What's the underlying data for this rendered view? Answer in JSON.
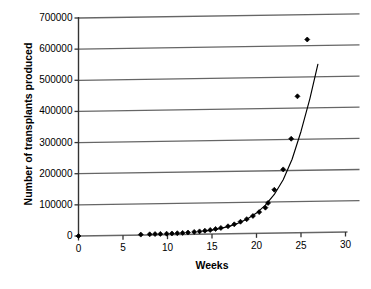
{
  "chart_data": {
    "type": "scatter",
    "title": "",
    "subtitle": "",
    "xlabel": "Weeks",
    "ylabel": "Number of transplants produced",
    "xlim": [
      0,
      30
    ],
    "ylim": [
      0,
      700000
    ],
    "xticks": [
      0,
      5,
      10,
      15,
      20,
      25,
      30
    ],
    "xtick_labels": [
      "0",
      "5",
      "10",
      "15",
      "20",
      "25",
      "30"
    ],
    "yticks": [
      0,
      100000,
      200000,
      300000,
      400000,
      500000,
      600000,
      700000
    ],
    "ytick_labels": [
      "0",
      "100000",
      "200000",
      "300000",
      "400000",
      "500000",
      "600000",
      "700000"
    ],
    "grid": "horizontal",
    "legend": "none",
    "marker": "diamond",
    "marker_color": "#000000",
    "line_color": "#000000",
    "grid_color": "#666666",
    "axis_color": "#333333",
    "background": "#ffffff",
    "series": [
      {
        "name": "Observed transplants",
        "type": "scatter",
        "points": [
          [
            0,
            0
          ],
          [
            7.0,
            1500
          ],
          [
            8.0,
            2000
          ],
          [
            8.6,
            2500
          ],
          [
            9.2,
            2800
          ],
          [
            9.9,
            3200
          ],
          [
            10.5,
            3600
          ],
          [
            11.1,
            4200
          ],
          [
            11.7,
            5000
          ],
          [
            12.3,
            6000
          ],
          [
            13.0,
            7500
          ],
          [
            13.6,
            9000
          ],
          [
            14.2,
            11000
          ],
          [
            14.8,
            13000
          ],
          [
            15.4,
            16000
          ],
          [
            16.0,
            19000
          ],
          [
            16.8,
            24000
          ],
          [
            17.5,
            30000
          ],
          [
            18.2,
            38000
          ],
          [
            18.9,
            46000
          ],
          [
            19.6,
            56000
          ],
          [
            20.3,
            68000
          ],
          [
            21.0,
            82000
          ],
          [
            21.3,
            97000
          ],
          [
            22.0,
            139000
          ],
          [
            23.0,
            204000
          ],
          [
            23.9,
            302000
          ],
          [
            24.6,
            438000
          ],
          [
            25.7,
            620000
          ]
        ]
      },
      {
        "name": "Fitted exponential curve",
        "type": "line",
        "points": [
          [
            14.0,
            9000
          ],
          [
            15.0,
            12500
          ],
          [
            16.0,
            17500
          ],
          [
            17.0,
            24500
          ],
          [
            18.0,
            34000
          ],
          [
            19.0,
            47000
          ],
          [
            20.0,
            65000
          ],
          [
            21.0,
            90000
          ],
          [
            22.0,
            124000
          ],
          [
            23.0,
            171000
          ],
          [
            24.0,
            236000
          ],
          [
            25.0,
            325000
          ],
          [
            26.0,
            430000
          ],
          [
            26.9,
            540000
          ]
        ]
      }
    ]
  },
  "axes": {
    "x_axis_name": "Weeks",
    "y_axis_name": "Number of transplants produced"
  }
}
